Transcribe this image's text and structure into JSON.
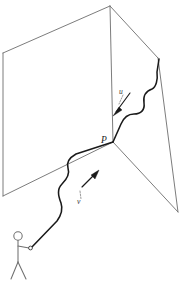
{
  "figure": {
    "background_color": "#ffffff",
    "width": 186,
    "height": 281,
    "labels": {
      "intersection_point": "P",
      "outgoing_vector": "u",
      "incoming_vector": "v"
    },
    "colors": {
      "plane_edge": "#6d6d6d",
      "ray": "#1a1a1a",
      "arrow": "#1a1a1a",
      "person": "#707070",
      "leader": "#555555"
    },
    "elements": {
      "left_plane_name": "left-plane",
      "right_plane_name": "right-plane",
      "ray_name": "wavy-light-ray",
      "person_name": "stick-figure-observer",
      "lamp_name": "handheld-light-source"
    },
    "geometry": {
      "apex": [
        110,
        6
      ],
      "intersection": [
        113,
        142
      ],
      "left_plane_corners": "110,6 3,53 3,196 113,142",
      "right_plane_corners": "110,6 158,58 178,212 113,142",
      "ray_start": [
        30,
        248
      ],
      "ray_end": [
        160,
        59
      ]
    }
  }
}
